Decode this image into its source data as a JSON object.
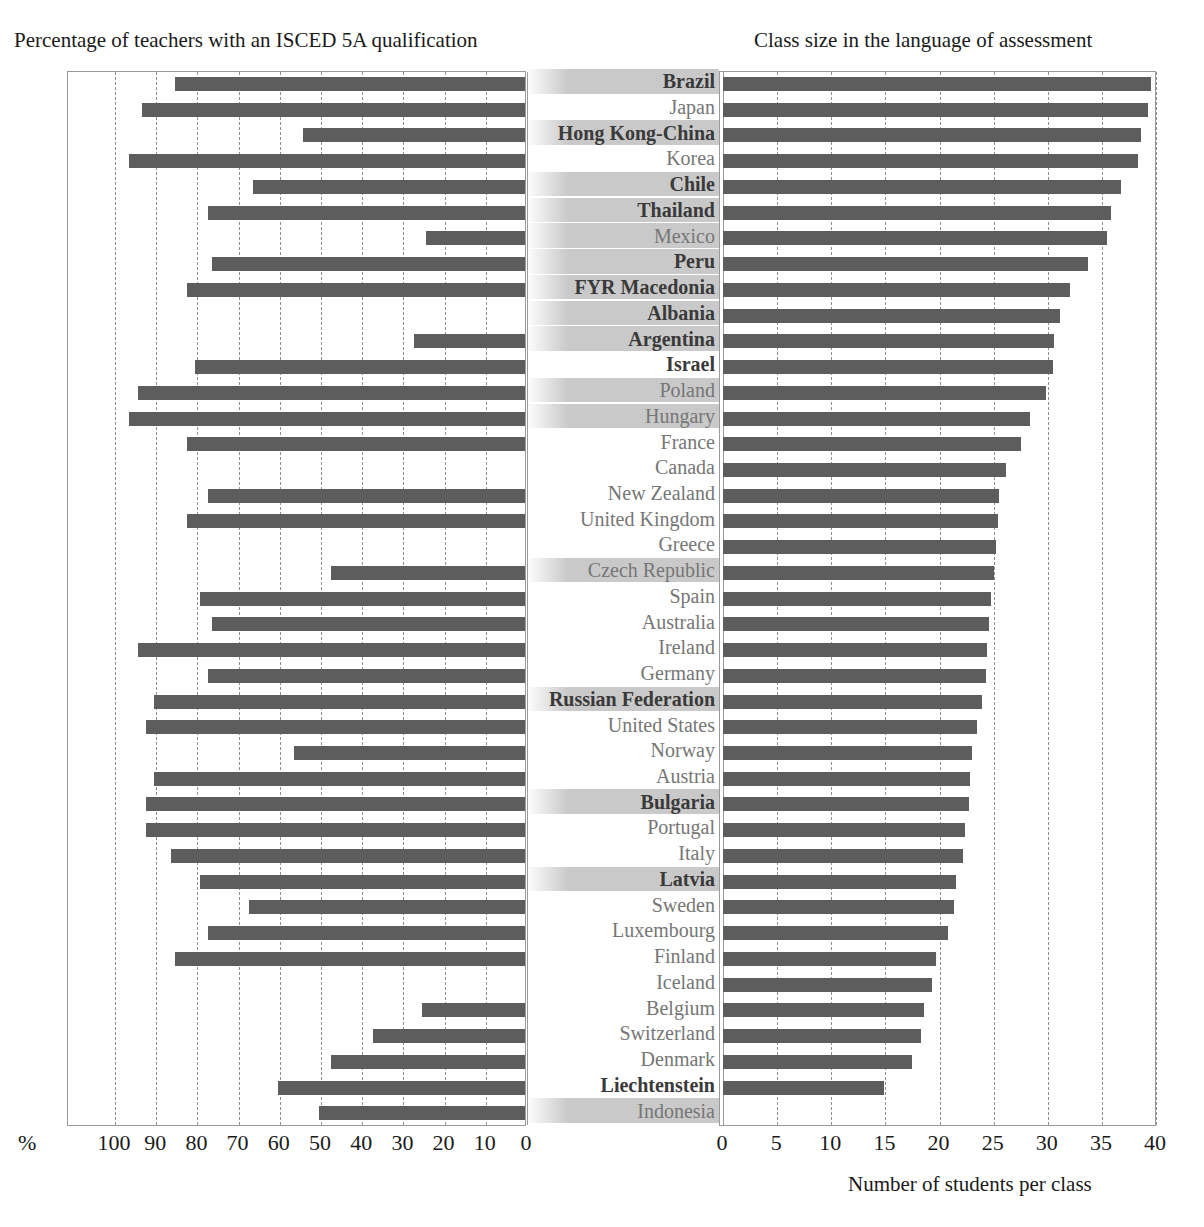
{
  "titles": {
    "left": "Percentage of teachers with an ISCED 5A qualification",
    "right": "Class size in the language of assessment"
  },
  "axes": {
    "left": {
      "unit_label": "%",
      "ticks": [
        "100",
        "90",
        "80",
        "70",
        "60",
        "50",
        "40",
        "30",
        "20",
        "10",
        "0"
      ],
      "range": [
        100,
        0
      ],
      "reversed": true,
      "grid": true
    },
    "right": {
      "ticks": [
        "0",
        "5",
        "10",
        "15",
        "20",
        "25",
        "30",
        "35",
        "40"
      ],
      "range": [
        0,
        40
      ],
      "xlabel": "Number of students per class",
      "grid": true
    }
  },
  "colors": {
    "bar": "#5d5d5d",
    "highlight_band": "#c9c9c9",
    "frame": "#9a9a9a",
    "gridline": "#8d8d8d",
    "partner_label": "#3a3a3a",
    "oecd_label": "#767676"
  },
  "chart_data": [
    {
      "type": "bar",
      "orientation": "horizontal",
      "title": "Percentage of teachers with an ISCED 5A qualification",
      "xlabel": "%",
      "ylabel": "",
      "xlim": [
        100,
        0
      ],
      "grid": true,
      "reversed_axis": true,
      "categories": [
        "Brazil",
        "Japan",
        "Hong Kong-China",
        "Korea",
        "Chile",
        "Thailand",
        "Mexico",
        "Peru",
        "FYR Macedonia",
        "Albania",
        "Argentina",
        "Israel",
        "Poland",
        "Hungary",
        "France",
        "Canada",
        "New Zealand",
        "United Kingdom",
        "Greece",
        "Czech Republic",
        "Spain",
        "Australia",
        "Ireland",
        "Germany",
        "Russian Federation",
        "United States",
        "Norway",
        "Austria",
        "Bulgaria",
        "Portugal",
        "Italy",
        "Latvia",
        "Sweden",
        "Luxembourg",
        "Finland",
        "Iceland",
        "Belgium",
        "Switzerland",
        "Denmark",
        "Liechtenstein",
        "Indonesia"
      ],
      "values": [
        85,
        93,
        54,
        96,
        66,
        77,
        24,
        76,
        82,
        null,
        27,
        80,
        94,
        96,
        82,
        null,
        77,
        82,
        null,
        47,
        79,
        76,
        94,
        77,
        90,
        92,
        56,
        90,
        92,
        92,
        86,
        79,
        67,
        77,
        85,
        null,
        25,
        37,
        47,
        60,
        50
      ]
    },
    {
      "type": "bar",
      "orientation": "horizontal",
      "title": "Class size in the language of assessment",
      "xlabel": "Number of students per class",
      "ylabel": "",
      "xlim": [
        0,
        40
      ],
      "grid": true,
      "categories": [
        "Brazil",
        "Japan",
        "Hong Kong-China",
        "Korea",
        "Chile",
        "Thailand",
        "Mexico",
        "Peru",
        "FYR Macedonia",
        "Albania",
        "Argentina",
        "Israel",
        "Poland",
        "Hungary",
        "France",
        "Canada",
        "New Zealand",
        "United Kingdom",
        "Greece",
        "Czech Republic",
        "Spain",
        "Australia",
        "Ireland",
        "Germany",
        "Russian Federation",
        "United States",
        "Norway",
        "Austria",
        "Bulgaria",
        "Portugal",
        "Italy",
        "Latvia",
        "Sweden",
        "Luxembourg",
        "Finland",
        "Iceland",
        "Belgium",
        "Switzerland",
        "Denmark",
        "Liechtenstein",
        "Indonesia"
      ],
      "values": [
        39.5,
        39.3,
        38.6,
        38.3,
        36.8,
        35.8,
        35.5,
        33.7,
        32.1,
        31.1,
        30.6,
        30.5,
        29.8,
        28.4,
        27.5,
        26.1,
        25.5,
        25.4,
        25.2,
        25.0,
        24.8,
        24.6,
        24.4,
        24.3,
        23.9,
        23.5,
        23.0,
        22.8,
        22.7,
        22.4,
        22.2,
        21.5,
        21.3,
        20.8,
        19.7,
        19.3,
        18.6,
        18.3,
        17.5,
        14.9,
        null
      ]
    }
  ],
  "rows": [
    {
      "label": "Brazil",
      "group": "partner",
      "highlight": true,
      "left": 85,
      "right": 39.5
    },
    {
      "label": "Japan",
      "group": "oecd",
      "highlight": false,
      "left": 93,
      "right": 39.3
    },
    {
      "label": "Hong Kong-China",
      "group": "partner",
      "highlight": true,
      "left": 54,
      "right": 38.6
    },
    {
      "label": "Korea",
      "group": "oecd",
      "highlight": false,
      "left": 96,
      "right": 38.3
    },
    {
      "label": "Chile",
      "group": "partner",
      "highlight": true,
      "left": 66,
      "right": 36.8
    },
    {
      "label": "Thailand",
      "group": "partner",
      "highlight": true,
      "left": 77,
      "right": 35.8
    },
    {
      "label": "Mexico",
      "group": "oecd",
      "highlight": true,
      "left": 24,
      "right": 35.5
    },
    {
      "label": "Peru",
      "group": "partner",
      "highlight": true,
      "left": 76,
      "right": 33.7
    },
    {
      "label": "FYR Macedonia",
      "group": "partner",
      "highlight": true,
      "left": 82,
      "right": 32.1
    },
    {
      "label": "Albania",
      "group": "partner",
      "highlight": true,
      "left": null,
      "right": 31.1
    },
    {
      "label": "Argentina",
      "group": "partner",
      "highlight": true,
      "left": 27,
      "right": 30.6
    },
    {
      "label": "Israel",
      "group": "partner",
      "highlight": false,
      "left": 80,
      "right": 30.5
    },
    {
      "label": "Poland",
      "group": "oecd",
      "highlight": true,
      "left": 94,
      "right": 29.8
    },
    {
      "label": "Hungary",
      "group": "oecd",
      "highlight": true,
      "left": 96,
      "right": 28.4
    },
    {
      "label": "France",
      "group": "oecd",
      "highlight": false,
      "left": 82,
      "right": 27.5
    },
    {
      "label": "Canada",
      "group": "oecd",
      "highlight": false,
      "left": null,
      "right": 26.1
    },
    {
      "label": "New Zealand",
      "group": "oecd",
      "highlight": false,
      "left": 77,
      "right": 25.5
    },
    {
      "label": "United Kingdom",
      "group": "oecd",
      "highlight": false,
      "left": 82,
      "right": 25.4
    },
    {
      "label": "Greece",
      "group": "oecd",
      "highlight": false,
      "left": null,
      "right": 25.2
    },
    {
      "label": "Czech Republic",
      "group": "oecd",
      "highlight": true,
      "left": 47,
      "right": 25.0
    },
    {
      "label": "Spain",
      "group": "oecd",
      "highlight": false,
      "left": 79,
      "right": 24.8
    },
    {
      "label": "Australia",
      "group": "oecd",
      "highlight": false,
      "left": 76,
      "right": 24.6
    },
    {
      "label": "Ireland",
      "group": "oecd",
      "highlight": false,
      "left": 94,
      "right": 24.4
    },
    {
      "label": "Germany",
      "group": "oecd",
      "highlight": false,
      "left": 77,
      "right": 24.3
    },
    {
      "label": "Russian Federation",
      "group": "partner",
      "highlight": true,
      "left": 90,
      "right": 23.9
    },
    {
      "label": "United States",
      "group": "oecd",
      "highlight": false,
      "left": 92,
      "right": 23.5
    },
    {
      "label": "Norway",
      "group": "oecd",
      "highlight": false,
      "left": 56,
      "right": 23.0
    },
    {
      "label": "Austria",
      "group": "oecd",
      "highlight": false,
      "left": 90,
      "right": 22.8
    },
    {
      "label": "Bulgaria",
      "group": "partner",
      "highlight": true,
      "left": 92,
      "right": 22.7
    },
    {
      "label": "Portugal",
      "group": "oecd",
      "highlight": false,
      "left": 92,
      "right": 22.4
    },
    {
      "label": "Italy",
      "group": "oecd",
      "highlight": false,
      "left": 86,
      "right": 22.2
    },
    {
      "label": "Latvia",
      "group": "partner",
      "highlight": true,
      "left": 79,
      "right": 21.5
    },
    {
      "label": "Sweden",
      "group": "oecd",
      "highlight": false,
      "left": 67,
      "right": 21.3
    },
    {
      "label": "Luxembourg",
      "group": "oecd",
      "highlight": false,
      "left": 77,
      "right": 20.8
    },
    {
      "label": "Finland",
      "group": "oecd",
      "highlight": false,
      "left": 85,
      "right": 19.7
    },
    {
      "label": "Iceland",
      "group": "oecd",
      "highlight": false,
      "left": null,
      "right": 19.3
    },
    {
      "label": "Belgium",
      "group": "oecd",
      "highlight": false,
      "left": 25,
      "right": 18.6
    },
    {
      "label": "Switzerland",
      "group": "oecd",
      "highlight": false,
      "left": 37,
      "right": 18.3
    },
    {
      "label": "Denmark",
      "group": "oecd",
      "highlight": false,
      "left": 47,
      "right": 17.5
    },
    {
      "label": "Liechtenstein",
      "group": "partner",
      "highlight": false,
      "left": 60,
      "right": 14.9
    },
    {
      "label": "Indonesia",
      "group": "oecd",
      "highlight": true,
      "left": 50,
      "right": null
    }
  ]
}
